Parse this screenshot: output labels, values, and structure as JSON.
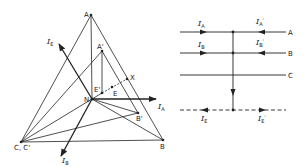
{
  "left_diagram": {
    "points": {
      "A": {
        "label": "A",
        "x": 91,
        "y": 15
      },
      "A_prime": {
        "label": "A'",
        "x": 102,
        "y": 51
      },
      "X": {
        "label": "X",
        "x": 127,
        "y": 79
      },
      "E": {
        "label": "E",
        "x": 112,
        "y": 87
      },
      "E_prime": {
        "label": "E'",
        "x": 102,
        "y": 93
      },
      "N": {
        "label": "N",
        "x": 92,
        "y": 99
      },
      "B_prime": {
        "label": "B'",
        "x": 138,
        "y": 113
      },
      "C": {
        "label": "C, C'",
        "x": 21,
        "y": 142
      },
      "B": {
        "label": "B",
        "x": 163,
        "y": 140
      }
    },
    "vectors": {
      "I_A": {
        "main": "I",
        "sub": "A"
      },
      "I_B": {
        "main": "I",
        "sub": "B"
      },
      "I_E": {
        "main": "I",
        "sub": "E"
      }
    }
  },
  "right_diagram": {
    "lines": [
      {
        "label": "A",
        "in": {
          "main": "I",
          "sub": "A"
        },
        "out": {
          "main": "I",
          "sub": "A",
          "prime": "'"
        }
      },
      {
        "label": "B",
        "in": {
          "main": "I",
          "sub": "B"
        },
        "out": {
          "main": "I",
          "sub": "B",
          "prime": "'"
        }
      },
      {
        "label": "C"
      }
    ],
    "earth": {
      "in": {
        "main": "I",
        "sub": "E"
      },
      "out": {
        "main": "I",
        "sub": "E",
        "prime": "'"
      }
    }
  },
  "colors": {
    "ink": "#222222",
    "background": "#ffffff"
  }
}
